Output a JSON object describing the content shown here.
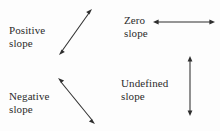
{
  "diagram": {
    "background_color": "#fdfdfd",
    "ink_color": "#2e2e2e",
    "items": [
      {
        "id": "positive",
        "label_line1": "Positive",
        "label_line2": "slope",
        "arrow_name": "diagonal-up-right-double-arrow",
        "arrow_direction": "up-right",
        "arrow_style": "double-headed",
        "x1": 59,
        "y1": 55,
        "x2": 92,
        "y2": 9
      },
      {
        "id": "negative",
        "label_line1": "Negative",
        "label_line2": "slope",
        "arrow_name": "diagonal-down-right-double-arrow",
        "arrow_direction": "down-right",
        "arrow_style": "double-headed",
        "x1": 58,
        "y1": 78,
        "x2": 95,
        "y2": 124
      },
      {
        "id": "zero",
        "label_line1": "Zero",
        "label_line2": "slope",
        "arrow_name": "horizontal-double-arrow",
        "arrow_direction": "horizontal",
        "arrow_style": "double-headed",
        "x1": 153,
        "y1": 22,
        "x2": 215,
        "y2": 22
      },
      {
        "id": "undefined",
        "label_line1": "Undefined",
        "label_line2": "slope",
        "arrow_name": "vertical-double-arrow",
        "arrow_direction": "vertical",
        "arrow_style": "double-headed",
        "x1": 190,
        "y1": 56,
        "x2": 190,
        "y2": 116
      }
    ]
  }
}
